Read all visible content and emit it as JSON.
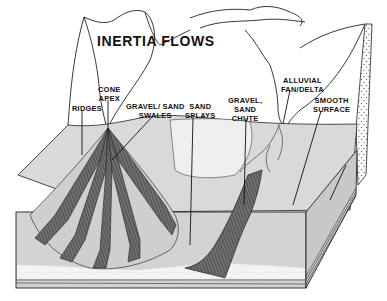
{
  "title": "INERTIA FLOWS",
  "labels": {
    "cone_apex": "CONE\nAPEX",
    "ridges": "RIDGES",
    "gravel_sand_swales": "GRAVEL/ SAND\nSWALES",
    "sand_splays": "SAND\nSPLAYS",
    "gravel_sand_chute": "GRAVEL,\nSAND\nCHUTE",
    "alluvial_fan_delta": "ALLUVIAL\nFAN/DELTA",
    "smooth_surface": "SMOOTH\nSURFACE"
  },
  "colors": {
    "line": "#222222",
    "fill_light": "#d9d9d9",
    "fill_mid": "#c4c4c4",
    "fill_dark": "#555555",
    "sand": "#f2f2f2",
    "background": "#ffffff"
  }
}
